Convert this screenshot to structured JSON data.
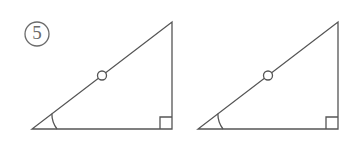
{
  "figure": {
    "canvas": {
      "width": 352,
      "height": 142,
      "background": "#ffffff"
    },
    "stroke_color": "#555555",
    "label_color": "#6b6b6b",
    "stroke_width": 1.3,
    "label": {
      "text": "5",
      "style": "circled-number",
      "center_x": 37,
      "center_y": 34,
      "radius": 12
    },
    "shapes": [
      {
        "name": "right-triangle-left",
        "vertices": {
          "bottom_left": {
            "x": 32,
            "y": 129
          },
          "bottom_right": {
            "x": 172,
            "y": 129
          },
          "top_right": {
            "x": 172,
            "y": 22
          }
        },
        "angle_arc": {
          "vertex": "bottom_left",
          "radius": 25
        },
        "right_angle_mark": {
          "vertex": "bottom_right",
          "size": 12
        },
        "hypotenuse_marker": {
          "type": "circle",
          "x": 102,
          "y": 75.5,
          "radius": 4.5
        }
      },
      {
        "name": "right-triangle-right",
        "vertices": {
          "bottom_left": {
            "x": 198,
            "y": 129
          },
          "bottom_right": {
            "x": 338,
            "y": 129
          },
          "top_right": {
            "x": 338,
            "y": 22
          }
        },
        "angle_arc": {
          "vertex": "bottom_left",
          "radius": 25
        },
        "right_angle_mark": {
          "vertex": "bottom_right",
          "size": 12
        },
        "hypotenuse_marker": {
          "type": "circle",
          "x": 268,
          "y": 75.5,
          "radius": 4.5
        }
      }
    ]
  }
}
